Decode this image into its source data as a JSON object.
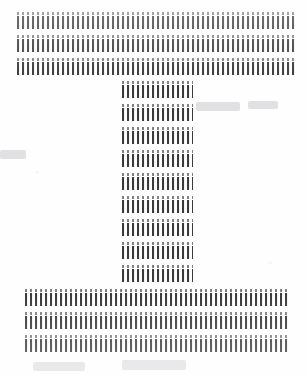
{
  "document": {
    "kind": "scanned-page",
    "title": "Scanned letterform page",
    "depicted_glyph": "T",
    "description": "A large capital letter T rendered as bands of dot-matrix hatching on off-white paper",
    "page_width_px": 307,
    "page_height_px": 375
  },
  "colors": {
    "page_background": "#fefefe",
    "bar_ink": "#3a3a3a",
    "dot_ink": "#5c5c5c",
    "bar_highlight": "#f2f2f2",
    "ghost_mark": "#e1e1e4"
  },
  "texture": {
    "pitch_px": 5,
    "bar_width_px": 2,
    "dot_width_px": 2,
    "dot_band_height_px": 3,
    "gap_between_dot_and_bar_px": 1
  },
  "glyph": {
    "name": "letter-t",
    "crossbar": {
      "name": "crossbar",
      "left_px": 17,
      "right_px": 297,
      "width_px": 280,
      "rows": [
        {
          "index": 0,
          "top_px": 12,
          "height_px": 17
        },
        {
          "index": 1,
          "top_px": 35,
          "height_px": 17
        },
        {
          "index": 2,
          "top_px": 58,
          "height_px": 17
        }
      ]
    },
    "stem": {
      "name": "stem",
      "left_px": 122,
      "right_px": 193,
      "width_px": 71,
      "rows": [
        {
          "index": 0,
          "top_px": 81,
          "height_px": 17
        },
        {
          "index": 1,
          "top_px": 104,
          "height_px": 17
        },
        {
          "index": 2,
          "top_px": 127,
          "height_px": 17
        },
        {
          "index": 3,
          "top_px": 150,
          "height_px": 17
        },
        {
          "index": 4,
          "top_px": 173,
          "height_px": 17
        },
        {
          "index": 5,
          "top_px": 196,
          "height_px": 17
        },
        {
          "index": 6,
          "top_px": 219,
          "height_px": 17
        },
        {
          "index": 7,
          "top_px": 242,
          "height_px": 17
        },
        {
          "index": 8,
          "top_px": 265,
          "height_px": 17
        }
      ]
    },
    "base": {
      "name": "base",
      "left_px": 25,
      "right_px": 288,
      "width_px": 263,
      "rows": [
        {
          "index": 0,
          "top_px": 289,
          "height_px": 17
        },
        {
          "index": 1,
          "top_px": 312,
          "height_px": 17
        },
        {
          "index": 2,
          "top_px": 335,
          "height_px": 17
        }
      ]
    }
  },
  "ghost_marks": [
    {
      "left_px": 0,
      "top_px": 150,
      "width_px": 26,
      "height_px": 9
    },
    {
      "left_px": 196,
      "top_px": 102,
      "width_px": 44,
      "height_px": 9
    },
    {
      "left_px": 248,
      "top_px": 101,
      "width_px": 30,
      "height_px": 8
    },
    {
      "left_px": 33,
      "top_px": 362,
      "width_px": 52,
      "height_px": 9
    },
    {
      "left_px": 122,
      "top_px": 360,
      "width_px": 64,
      "height_px": 10
    }
  ]
}
